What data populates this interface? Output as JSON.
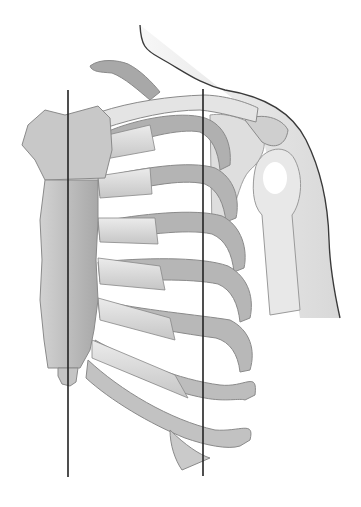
{
  "figure": {
    "structures": [
      "neck-outline",
      "shoulder-outline",
      "clavicle",
      "scapula-coracoid",
      "humerus-head",
      "humerus-shaft",
      "sternum-manubrium",
      "sternum-body",
      "xiphoid-process",
      "ribs",
      "costal-cartilage"
    ],
    "reference_lines": [
      {
        "name": "left-vertical-line",
        "x": 68,
        "y_start": 90,
        "y_end": 477
      },
      {
        "name": "right-vertical-line",
        "x": 203,
        "y_start": 89,
        "y_end": 476
      }
    ],
    "colors": {
      "background": "#ffffff",
      "bone_light": "#e2e2e2",
      "bone_mid": "#c4c4c4",
      "bone_dark": "#9a9a9a",
      "skin": "#eeeeee",
      "outline": "#3a3a3a",
      "reference_line": "#222222"
    },
    "rib_count_visible": 8
  }
}
